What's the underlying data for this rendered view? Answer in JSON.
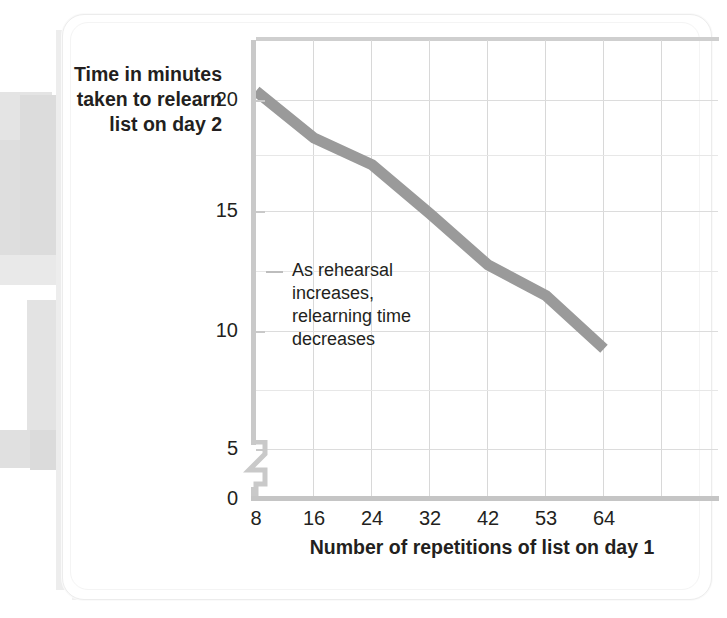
{
  "chart_data": {
    "type": "line",
    "title": "",
    "xlabel": "Number of repetitions of list on day 1",
    "ylabel": "Time in minutes taken to relearn list on day 2",
    "categories": [
      "8",
      "16",
      "24",
      "32",
      "42",
      "53",
      "64"
    ],
    "values": [
      20.0,
      17.7,
      16.4,
      14.0,
      11.5,
      10.0,
      7.4
    ],
    "series": [
      {
        "name": "Relearning time",
        "values": [
          20.0,
          17.7,
          16.4,
          14.0,
          11.5,
          10.0,
          7.4
        ]
      }
    ],
    "ylim": [
      0,
      22.5
    ],
    "y_ticks": [
      "0",
      "5",
      "10",
      "15",
      "20"
    ],
    "y_minor_gridlines": true,
    "x_ticks": [
      "8",
      "16",
      "24",
      "32",
      "42",
      "53",
      "64"
    ],
    "grid": true,
    "legend": "none",
    "axis_break": "y-axis break between 0 and 5",
    "annotation": "As rehearsal increases, relearning time decreases",
    "line_color": "#9a9a9a",
    "grid_color": "#d8d8d8",
    "text_color": "#231f20"
  },
  "axes": {
    "y_title_line1": "Time in minutes",
    "y_title_line2": "taken to relearn",
    "y_title_line3": "list on day 2",
    "x_title": "Number of repetitions of list on day 1",
    "y_tick_labels": [
      "20",
      "15",
      "10",
      "5",
      "0"
    ],
    "x_tick_labels": [
      "8",
      "16",
      "24",
      "32",
      "42",
      "53",
      "64"
    ]
  },
  "annotation": {
    "line1": "As rehearsal",
    "line2": "increases,",
    "line3": "relearning time",
    "line4": "decreases"
  }
}
